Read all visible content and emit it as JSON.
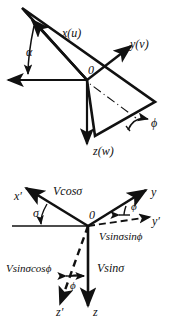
{
  "figure": {
    "background_color": "#ffffff",
    "stroke_color": "#111111",
    "panels": [
      {
        "id": "top",
        "name": "body-axes-rotation-diagram",
        "description": "Right-handed axis triad x(u), y(v), z(w) with plane and roll angle phi and angle alpha",
        "labels": {
          "x_axis": "x(u)",
          "y_axis": "y(v)",
          "z_axis": "z(w)",
          "origin": "0",
          "angle_alpha": "α",
          "angle_phi": "ϕ"
        }
      },
      {
        "id": "bottom",
        "name": "velocity-component-diagram",
        "description": "Velocity V resolved into components along x', y, y', z, z' axes using sigma and phi",
        "labels": {
          "x_prime_axis": "x′",
          "y_axis": "y",
          "y_prime_axis": "y′",
          "z_axis": "z",
          "z_prime_axis": "z′",
          "origin": "0",
          "angle_sigma": "σ",
          "angle_phi_upper": "ϕ",
          "angle_phi_lower": "ϕ",
          "comp_v_cos_sigma": "Vcosσ",
          "comp_v_sin_sigma_sin_phi": "Vsinσsinϕ",
          "comp_v_sin_sigma_cos_phi": "Vsinσcosϕ",
          "comp_v_sin_sigma": "Vsinσ"
        }
      }
    ]
  }
}
